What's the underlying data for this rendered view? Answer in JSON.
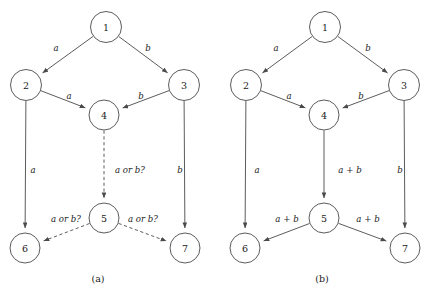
{
  "figure": {
    "width": 430,
    "height": 293,
    "background": "#ffffff",
    "stroke_color": "#4a4a4a",
    "text_color": "#1a1a1a"
  },
  "panels": [
    {
      "id": "panel-a",
      "caption": "(a)",
      "caption_pos": {
        "x": 98,
        "y": 278
      },
      "nodes": [
        {
          "id": "1",
          "label": "1",
          "cx": 106,
          "cy": 27,
          "r": 15.5
        },
        {
          "id": "2",
          "label": "2",
          "cx": 26,
          "cy": 85,
          "r": 15.5
        },
        {
          "id": "3",
          "label": "3",
          "cx": 184,
          "cy": 85,
          "r": 15.5
        },
        {
          "id": "4",
          "label": "4",
          "cx": 104,
          "cy": 115,
          "r": 15.0
        },
        {
          "id": "5",
          "label": "5",
          "cx": 104,
          "cy": 218,
          "r": 15.0
        },
        {
          "id": "6",
          "label": "6",
          "cx": 25,
          "cy": 248,
          "r": 15.0
        },
        {
          "id": "7",
          "label": "7",
          "cx": 185,
          "cy": 248,
          "r": 15.0
        }
      ],
      "edges": [
        {
          "from": "1",
          "to": "2",
          "label": "a",
          "label_pos": {
            "x": 56,
            "y": 48
          },
          "style": "solid"
        },
        {
          "from": "1",
          "to": "3",
          "label": "b",
          "label_pos": {
            "x": 148,
            "y": 48
          },
          "style": "solid"
        },
        {
          "from": "2",
          "to": "4",
          "label": "a",
          "label_pos": {
            "x": 69,
            "y": 96
          },
          "style": "solid"
        },
        {
          "from": "3",
          "to": "4",
          "label": "b",
          "label_pos": {
            "x": 141,
            "y": 96
          },
          "style": "solid"
        },
        {
          "from": "2",
          "to": "6",
          "label": "a",
          "label_pos": {
            "x": 33,
            "y": 170
          },
          "style": "solid"
        },
        {
          "from": "3",
          "to": "7",
          "label": "b",
          "label_pos": {
            "x": 180,
            "y": 170
          },
          "style": "solid"
        },
        {
          "from": "4",
          "to": "5",
          "label": "a or b?",
          "label_pos": {
            "x": 130,
            "y": 170
          },
          "style": "dashed"
        },
        {
          "from": "5",
          "to": "6",
          "label": "a or b?",
          "label_pos": {
            "x": 66,
            "y": 219
          },
          "style": "dashed"
        },
        {
          "from": "5",
          "to": "7",
          "label": "a or b?",
          "label_pos": {
            "x": 143,
            "y": 219
          },
          "style": "dashed"
        }
      ]
    },
    {
      "id": "panel-b",
      "caption": "(b)",
      "caption_pos": {
        "x": 322,
        "y": 278
      },
      "nodes": [
        {
          "id": "1",
          "label": "1",
          "cx": 325,
          "cy": 27,
          "r": 15.5
        },
        {
          "id": "2",
          "label": "2",
          "cx": 246,
          "cy": 85,
          "r": 15.5
        },
        {
          "id": "3",
          "label": "3",
          "cx": 404,
          "cy": 85,
          "r": 15.5
        },
        {
          "id": "4",
          "label": "4",
          "cx": 324,
          "cy": 115,
          "r": 15.0
        },
        {
          "id": "5",
          "label": "5",
          "cx": 324,
          "cy": 218,
          "r": 15.0
        },
        {
          "id": "6",
          "label": "6",
          "cx": 245,
          "cy": 248,
          "r": 15.0
        },
        {
          "id": "7",
          "label": "7",
          "cx": 405,
          "cy": 248,
          "r": 15.0
        }
      ],
      "edges": [
        {
          "from": "1",
          "to": "2",
          "label": "a",
          "label_pos": {
            "x": 276,
            "y": 48
          },
          "style": "solid"
        },
        {
          "from": "1",
          "to": "3",
          "label": "b",
          "label_pos": {
            "x": 368,
            "y": 48
          },
          "style": "solid"
        },
        {
          "from": "2",
          "to": "4",
          "label": "a",
          "label_pos": {
            "x": 289,
            "y": 96
          },
          "style": "solid"
        },
        {
          "from": "3",
          "to": "4",
          "label": "b",
          "label_pos": {
            "x": 361,
            "y": 96
          },
          "style": "solid"
        },
        {
          "from": "2",
          "to": "6",
          "label": "a",
          "label_pos": {
            "x": 257,
            "y": 170
          },
          "style": "solid"
        },
        {
          "from": "3",
          "to": "7",
          "label": "b",
          "label_pos": {
            "x": 400,
            "y": 170
          },
          "style": "solid"
        },
        {
          "from": "4",
          "to": "5",
          "label": "a + b",
          "label_pos": {
            "x": 350,
            "y": 170
          },
          "style": "solid"
        },
        {
          "from": "5",
          "to": "6",
          "label": "a + b",
          "label_pos": {
            "x": 287,
            "y": 219
          },
          "style": "solid"
        },
        {
          "from": "5",
          "to": "7",
          "label": "a + b",
          "label_pos": {
            "x": 368,
            "y": 219
          },
          "style": "solid"
        }
      ]
    }
  ]
}
